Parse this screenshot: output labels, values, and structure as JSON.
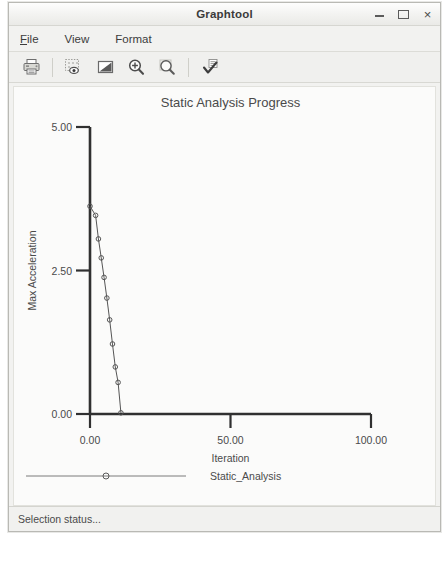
{
  "window": {
    "title": "Graphtool",
    "controls": {
      "minimize": "minimize",
      "maximize": "maximize",
      "close": "×"
    }
  },
  "menubar": {
    "items": [
      {
        "label": "File",
        "mnemonic": "F",
        "rest": "ile"
      },
      {
        "label": "View",
        "mnemonic": "V",
        "rest": "iew"
      },
      {
        "label": "Format",
        "mnemonic": "F",
        "rest": "ormat"
      }
    ]
  },
  "toolbar": {
    "buttons": [
      {
        "name": "print-icon",
        "title": "Print"
      },
      {
        "name": "preview-icon",
        "title": "Preview"
      },
      {
        "name": "graph-icon",
        "title": "Graph"
      },
      {
        "name": "zoom-in-icon",
        "title": "Zoom In"
      },
      {
        "name": "zoom-icon",
        "title": "Zoom"
      },
      {
        "name": "apply-check-icon",
        "title": "Apply"
      }
    ]
  },
  "statusbar": {
    "text": "Selection status..."
  },
  "chart_data": {
    "type": "line",
    "title": "Static Analysis Progress",
    "xlabel": "Iteration",
    "ylabel": "Max Acceleration",
    "xlim": [
      0,
      100
    ],
    "ylim": [
      0,
      5
    ],
    "xticks": [
      "0.00",
      "50.00",
      "100.00"
    ],
    "xtick_values": [
      0,
      50,
      100
    ],
    "yticks": [
      "0.00",
      "2.50",
      "5.00"
    ],
    "ytick_values": [
      0,
      2.5,
      5
    ],
    "grid": false,
    "legend_position": "bottom",
    "series": [
      {
        "name": "Static_Analysis",
        "color": "#555555",
        "marker": "circle",
        "x": [
          0,
          2,
          3,
          4,
          5,
          6,
          7,
          8,
          9,
          10,
          11
        ],
        "y": [
          3.62,
          3.46,
          3.05,
          2.72,
          2.38,
          2.02,
          1.64,
          1.22,
          0.82,
          0.55,
          0.02
        ]
      }
    ]
  }
}
